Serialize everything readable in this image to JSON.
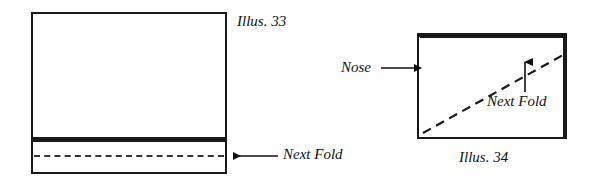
{
  "figure": {
    "type": "origami-folding-diagram",
    "ink_color": "#1a1a1a",
    "background": "#ffffff",
    "panels": [
      {
        "id": "illus-33",
        "caption": "Illus. 33",
        "shape": "rectangle-with-bottom-strip",
        "annotations": [
          {
            "label": "Next Fold",
            "pointer": "arrow-left",
            "target": "horizontal-dashed-line-in-bottom-strip"
          }
        ],
        "guides": [
          {
            "kind": "dashed-line",
            "orientation": "horizontal",
            "meaning": "Next Fold"
          }
        ]
      },
      {
        "id": "illus-34",
        "caption": "Illus. 34",
        "shape": "rectangle",
        "annotations": [
          {
            "label": "Nose",
            "pointer": "arrow-right",
            "target": "left-edge-of-rectangle"
          },
          {
            "label": "Next Fold",
            "pointer": "arrow-up",
            "target": "diagonal-dashed-line"
          }
        ],
        "guides": [
          {
            "kind": "dashed-line",
            "orientation": "diagonal",
            "meaning": "Next Fold"
          }
        ]
      }
    ]
  },
  "labels": {
    "illus_33": "Illus. 33",
    "illus_34": "Illus. 34",
    "next_fold_left": "Next Fold",
    "next_fold_right": "Next Fold",
    "nose": "Nose"
  }
}
